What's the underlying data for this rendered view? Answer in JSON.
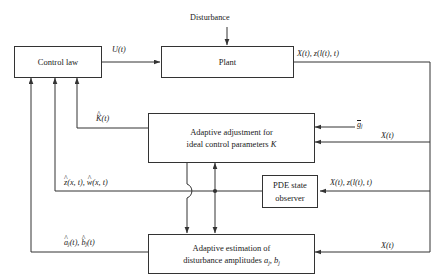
{
  "diagram": {
    "type": "control-system-block-diagram",
    "stroke_color": "#333333",
    "text_color": "#1a1a1a",
    "background": "#ffffff"
  },
  "blocks": {
    "control_law": {
      "label": "Control law"
    },
    "plant": {
      "label": "Plant"
    },
    "adaptive_adjustment": {
      "line1": "Adaptive adjustment for",
      "line2_pre": "ideal control parameters ",
      "line2_sym": "K"
    },
    "pde_observer": {
      "line1": "PDE state",
      "line2": "observer"
    },
    "adaptive_estimation": {
      "line1": "Adaptive estimation of",
      "line2_pre": "disturbance amplitudes ",
      "line2_a": "a",
      "line2_asub": "j",
      "line2_mid": ", ",
      "line2_b": "b",
      "line2_bsub": "j"
    }
  },
  "signals": {
    "disturbance": "Disturbance",
    "u_of_t": {
      "sym": "U",
      "arg": "(t)"
    },
    "plant_output": {
      "x": "X",
      "xarg": "(t), ",
      "z": "z",
      "zarg": "(",
      "l": "l",
      "larg": "(t), t)"
    },
    "k_hat": {
      "hat": "^",
      "sym": "K",
      "arg": "(t)"
    },
    "g_bar": {
      "sym": "g",
      "sub": "j"
    },
    "x_of_t_mid": {
      "sym": "X",
      "arg": "(t)"
    },
    "x_of_t_bottom": {
      "sym": "X",
      "arg": "(t)"
    },
    "observer_input": {
      "x": "X",
      "xarg": "(t), ",
      "z": "z",
      "zarg": "(",
      "l": "l",
      "larg": "(t), t)"
    },
    "state_estimates": {
      "zhat": "z",
      "zarg": "(x, t), ",
      "what": "w",
      "warg": "(x, t)"
    },
    "amplitude_estimates": {
      "a": "a",
      "asub": "j",
      "aarg": "(t), ",
      "b": "b",
      "bsub": "j",
      "barg": "(t)"
    }
  }
}
